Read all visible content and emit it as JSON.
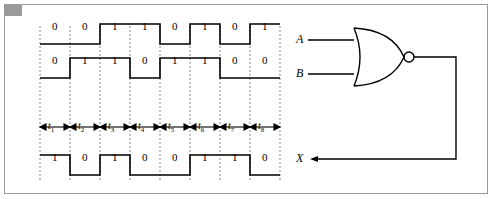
{
  "figure": {
    "background_color": "#ffffff",
    "line_color": "#000000",
    "frame_color": "#999999"
  },
  "waveforms": [
    {
      "name": "A",
      "bits": [
        "0",
        "0",
        "1",
        "1",
        "0",
        "1",
        "0",
        "1"
      ]
    },
    {
      "name": "B",
      "bits": [
        "0",
        "1",
        "1",
        "0",
        "1",
        "1",
        "0",
        "0"
      ]
    },
    {
      "name": "X",
      "bits": [
        "1",
        "0",
        "1",
        "0",
        "0",
        "1",
        "1",
        "0"
      ]
    }
  ],
  "time_intervals": [
    {
      "label": "t",
      "sub": "1"
    },
    {
      "label": "t",
      "sub": "2"
    },
    {
      "label": "t",
      "sub": "3"
    },
    {
      "label": "t",
      "sub": "4"
    },
    {
      "label": "t",
      "sub": "5"
    },
    {
      "label": "t",
      "sub": "6"
    },
    {
      "label": "t",
      "sub": "7"
    },
    {
      "label": "t",
      "sub": "8"
    }
  ],
  "circuit": {
    "gate_type": "NOR",
    "inputs": [
      {
        "label": "A"
      },
      {
        "label": "B"
      }
    ],
    "output": {
      "label": "X"
    }
  }
}
